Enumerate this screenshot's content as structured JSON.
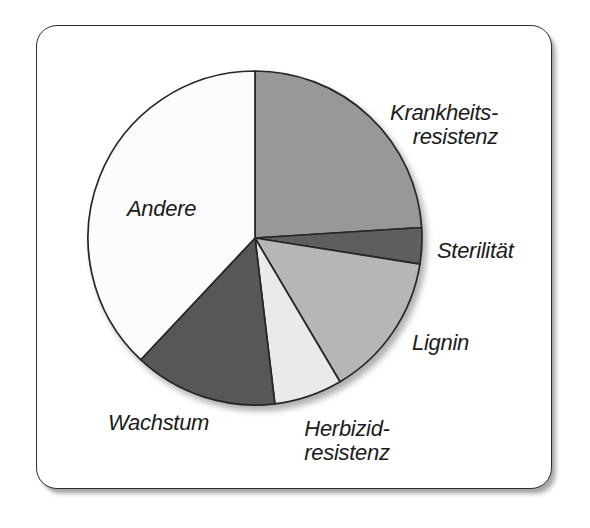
{
  "page": {
    "background_color": "#ffffff"
  },
  "card": {
    "background_color": "#ffffff",
    "border_color": "#2e2e2e"
  },
  "chart_data": {
    "type": "pie",
    "title": "",
    "values_shown_on_chart": false,
    "legend": "none",
    "start_angle_deg": 0,
    "direction": "clockwise",
    "outline_color": "#262626",
    "slices": [
      {
        "id": "krankheitsresistenz",
        "label": "Krankheits-\nresistenz",
        "value_percent": 24.0,
        "approx_angle_deg": 86.4,
        "color": "#989898"
      },
      {
        "id": "sterilitaet",
        "label": "Sterilität",
        "value_percent": 3.5,
        "approx_angle_deg": 12.6,
        "color": "#5e5e5e"
      },
      {
        "id": "lignin",
        "label": "Lignin",
        "value_percent": 14.0,
        "approx_angle_deg": 50.4,
        "color": "#b6b6b6"
      },
      {
        "id": "herbizidresistenz",
        "label": "Herbizid-\nresistenz",
        "value_percent": 6.6,
        "approx_angle_deg": 23.8,
        "color": "#eaeaea"
      },
      {
        "id": "wachstum",
        "label": "Wachstum",
        "value_percent": 13.9,
        "approx_angle_deg": 50.0,
        "color": "#575757"
      },
      {
        "id": "andere",
        "label": "Andere",
        "value_percent": 38.0,
        "approx_angle_deg": 136.8,
        "color": "#fcfcfc"
      }
    ]
  }
}
